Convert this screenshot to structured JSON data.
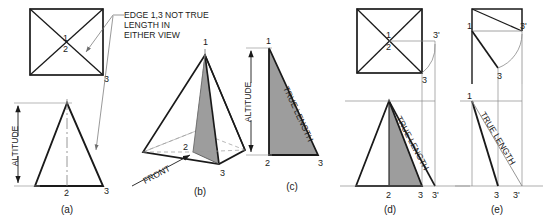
{
  "figure": {
    "annotation": {
      "line1": "EDGE 1,3 NOT TRUE",
      "line2": "LENGTH IN",
      "line3": "EITHER VIEW"
    },
    "colors": {
      "line": "#1a1a1a",
      "thin_line": "#8a8a8a",
      "shade_fill": "#9d9d9d",
      "background": "#ffffff"
    }
  },
  "panels": [
    {
      "id": "a",
      "caption": "(a)",
      "description": "Top view square with diagonals above front view triangle",
      "labels": {
        "top_center_upper": "1",
        "top_center_lower": "2",
        "top_right": "3",
        "front_apex": "1",
        "front_base_center": "2",
        "front_base_right": "3"
      },
      "dimension": "ALTITUDE"
    },
    {
      "id": "b",
      "caption": "(b)",
      "description": "Pictorial view of pyramid with shaded section 1-2-3",
      "labels": {
        "apex": "1",
        "center": "2",
        "corner": "3"
      },
      "direction_arrow": "FRONT"
    },
    {
      "id": "c",
      "caption": "(c)",
      "description": "Shaded right triangle showing true length of edge 1,3",
      "labels": {
        "apex": "1",
        "base_left": "2",
        "base_right": "3"
      },
      "dimension": "ALTITUDE",
      "hypotenuse_label": "TRUE LENGTH"
    },
    {
      "id": "d",
      "caption": "(d)",
      "description": "Revolution of point 3 to 3-prime in top and front views",
      "labels": {
        "top_center_upper": "1",
        "top_center_lower": "2",
        "top_three": "3",
        "top_three_prime": "3'",
        "front_base_left": "2",
        "front_base_three": "3",
        "front_base_three_prime": "3'"
      },
      "edge_label": "TRUE LENGTH"
    },
    {
      "id": "e",
      "caption": "(e)",
      "description": "Side view revolution showing true length of edge 1,3",
      "labels": {
        "top_left": "1",
        "top_three": "3",
        "top_three_prime": "3'",
        "front_left": "1",
        "front_base_three": "3",
        "front_base_three_prime": "3'"
      },
      "edge_label": "TRUE LENGTH"
    }
  ]
}
